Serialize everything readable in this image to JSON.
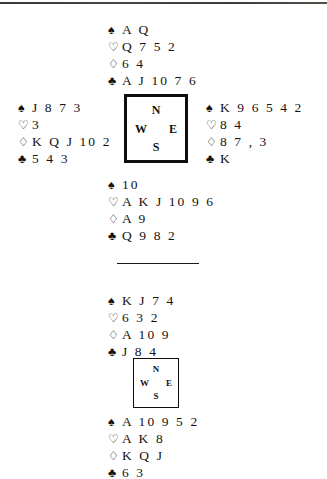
{
  "page": {
    "background_color": "#ffffff",
    "ink_color": "#15120f",
    "scan_edge": "top-dark-band"
  },
  "suit_symbols": {
    "spades": "♠",
    "hearts": "♡",
    "diamonds": "♢",
    "clubs": "♣"
  },
  "divider": {
    "label": "horizontal-rule"
  },
  "deals": [
    {
      "name": "upper-deal",
      "compass": {
        "north": "N",
        "west": "W",
        "east": "E",
        "south": "S"
      },
      "hands": {
        "north": {
          "spades": "A Q",
          "hearts": "Q 7 5 2",
          "diamonds": "6 4",
          "clubs": "A J 10 7 6"
        },
        "west": {
          "spades": "J 8 7 3",
          "hearts": "3",
          "diamonds": "K Q J 10 2",
          "clubs": "5 4 3"
        },
        "east": {
          "spades": "K 9 6 5 4 2",
          "hearts": "8 4",
          "diamonds": "8 7 , 3",
          "clubs": "K"
        },
        "south": {
          "spades": "10",
          "hearts": "A K J 10 9 6",
          "diamonds": "A 9",
          "clubs": "Q 9 8 2"
        }
      }
    },
    {
      "name": "lower-deal",
      "compass": {
        "north": "N",
        "west": "W",
        "east": "E",
        "south": "S"
      },
      "hands": {
        "north": {
          "spades": "K J 7 4",
          "hearts": "6 3 2",
          "diamonds": "A 10 9",
          "clubs": "J 8 4"
        },
        "south": {
          "spades": "A 10 9 5 2",
          "hearts": "A K 8",
          "diamonds": "K Q J",
          "clubs": "6 3"
        }
      }
    }
  ]
}
